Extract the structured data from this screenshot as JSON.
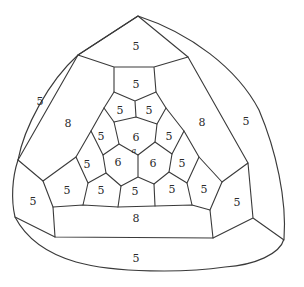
{
  "figure": {
    "vertex_label": "a",
    "face_labels": [
      {
        "id": "top-pentagon",
        "value": "5"
      },
      {
        "id": "inner-top-pentagon",
        "value": "5"
      },
      {
        "id": "outer-left",
        "value": "5"
      },
      {
        "id": "pent-upper-left",
        "value": "5"
      },
      {
        "id": "pent-upper-right",
        "value": "5"
      },
      {
        "id": "octagon-left",
        "value": "8"
      },
      {
        "id": "octagon-right",
        "value": "8"
      },
      {
        "id": "outer-right",
        "value": "5"
      },
      {
        "id": "pent-mid-left",
        "value": "5"
      },
      {
        "id": "hexagon-top",
        "value": "6"
      },
      {
        "id": "pent-mid-right",
        "value": "5"
      },
      {
        "id": "pent-left",
        "value": "5"
      },
      {
        "id": "hexagon-left",
        "value": "6"
      },
      {
        "id": "hexagon-right",
        "value": "6"
      },
      {
        "id": "pent-right",
        "value": "5"
      },
      {
        "id": "pent-lower-left",
        "value": "5"
      },
      {
        "id": "pent-bottom-left",
        "value": "5"
      },
      {
        "id": "pent-bottom-center",
        "value": "5"
      },
      {
        "id": "pent-bottom-right",
        "value": "5"
      },
      {
        "id": "pent-lower-right",
        "value": "5"
      },
      {
        "id": "corner-left",
        "value": "5"
      },
      {
        "id": "corner-right",
        "value": "5"
      },
      {
        "id": "octagon-bottom",
        "value": "8"
      },
      {
        "id": "outer-bottom",
        "value": "5"
      }
    ],
    "colors": {
      "line": "#3a3a3a",
      "background": "#ffffff",
      "text": "#2b2b2b"
    }
  }
}
